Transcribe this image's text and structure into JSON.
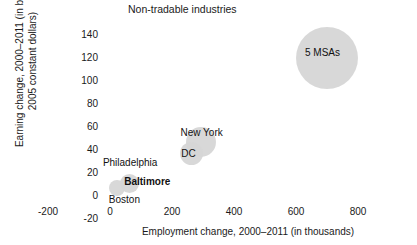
{
  "chart_data": {
    "type": "scatter",
    "title": "Non-tradable industries",
    "xlabel": "Employment change, 2000–2011 (in thousands)",
    "ylabel_line1": "Earning change, 2000–2011 (in billions",
    "ylabel_line2": "2005 constant dollars)",
    "xlim": [
      -280,
      880
    ],
    "ylim": [
      -20,
      150
    ],
    "xticks": [
      "-200",
      "0",
      "200",
      "400",
      "600",
      "800"
    ],
    "xtick_values": [
      -200,
      0,
      200,
      400,
      600,
      800
    ],
    "yticks": [
      "-20",
      "0",
      "20",
      "40",
      "60",
      "80",
      "100",
      "120",
      "140"
    ],
    "ytick_values": [
      -20,
      0,
      20,
      40,
      60,
      80,
      100,
      120,
      140
    ],
    "grid": false,
    "legend": "none",
    "bubble_color": "#d6d6d6",
    "points": [
      {
        "label": "5 MSAs",
        "x": 700,
        "y": 120,
        "size": 62,
        "label_dx": -22,
        "label_dy": -5,
        "bold": false
      },
      {
        "label": "New York",
        "x": 292,
        "y": 47,
        "size": 30,
        "label_dx": -20,
        "label_dy": -9,
        "bold": false
      },
      {
        "label": "DC",
        "x": 262,
        "y": 37,
        "size": 23,
        "label_dx": -10,
        "label_dy": 1,
        "bold": false
      },
      {
        "label": "Baltimore",
        "x": 62,
        "y": 11,
        "size": 19,
        "label_dx": -5,
        "label_dy": -1,
        "bold": true
      },
      {
        "label": "Boston",
        "x": 22,
        "y": 7,
        "size": 16,
        "label_dx": -8,
        "label_dy": 12,
        "bold": false
      },
      {
        "label": "Philadelphia",
        "x": 48,
        "y": 22,
        "size": 0,
        "label_dx": -22,
        "label_dy": -8,
        "bold": false
      }
    ]
  }
}
